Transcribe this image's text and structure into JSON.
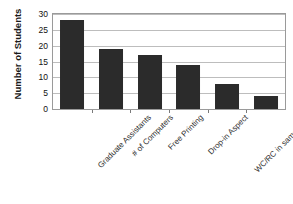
{
  "chart_data": {
    "type": "bar",
    "title": "",
    "xlabel": "",
    "ylabel": "Number of Students",
    "categories": [
      "Graduate Assistants",
      "# of Computers",
      "Free Printing",
      "Drop-in Aspect",
      "WC/RC in same room",
      "Comfortable Environment"
    ],
    "values": [
      28,
      19,
      17,
      14,
      8,
      4
    ],
    "ylim": [
      0,
      30
    ],
    "yticks": [
      0,
      5,
      10,
      15,
      20,
      25,
      30
    ],
    "ytick_labels": [
      "0",
      "5",
      "10",
      "15",
      "20",
      "25",
      "30"
    ],
    "grid": true,
    "legend": false,
    "bar_color": "#2b2b2b",
    "grid_color": "#bdbdbd",
    "frame_color": "#9a9a9a",
    "background": "#ffffff"
  }
}
